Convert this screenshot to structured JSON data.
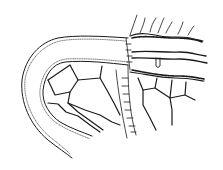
{
  "figure": {
    "stroke_color": "#1a1a1a",
    "background": "#ffffff",
    "labels": []
  }
}
